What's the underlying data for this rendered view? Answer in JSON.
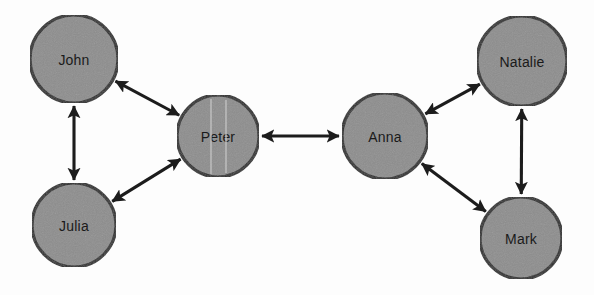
{
  "diagram": {
    "background_color": "#fdfdfd",
    "node_fill_color": "#8d8d8d",
    "node_stroke_color": "#2b2b2b",
    "edge_color": "#1c1c1c",
    "label_color": "#1a1a1a",
    "nodes": [
      {
        "id": "john",
        "label": "John",
        "cx": 74,
        "cy": 59,
        "r": 44
      },
      {
        "id": "julia",
        "label": "Julia",
        "cx": 74,
        "cy": 225,
        "r": 42
      },
      {
        "id": "peter",
        "label": "Peter",
        "cx": 218,
        "cy": 136,
        "r": 41
      },
      {
        "id": "anna",
        "label": "Anna",
        "cx": 385,
        "cy": 136,
        "r": 43
      },
      {
        "id": "natalie",
        "label": "Natalie",
        "cx": 522,
        "cy": 61,
        "r": 45
      },
      {
        "id": "mark",
        "label": "Mark",
        "cx": 521,
        "cy": 238,
        "r": 41
      }
    ],
    "edges": [
      {
        "id": "john-julia",
        "from": "john",
        "to": "julia",
        "arrows": "both"
      },
      {
        "id": "john-peter",
        "from": "john",
        "to": "peter",
        "arrows": "both"
      },
      {
        "id": "julia-peter",
        "from": "julia",
        "to": "peter",
        "arrows": "both"
      },
      {
        "id": "peter-anna",
        "from": "peter",
        "to": "anna",
        "arrows": "both"
      },
      {
        "id": "anna-natalie",
        "from": "anna",
        "to": "natalie",
        "arrows": "both"
      },
      {
        "id": "anna-mark",
        "from": "anna",
        "to": "mark",
        "arrows": "both"
      },
      {
        "id": "natalie-mark",
        "from": "natalie",
        "to": "mark",
        "arrows": "both"
      }
    ]
  }
}
